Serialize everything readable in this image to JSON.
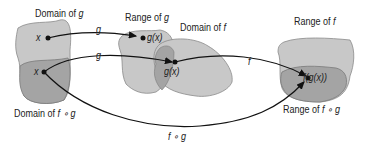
{
  "labels": {
    "domain_g": {
      "text": "Domain of ",
      "var": "g"
    },
    "range_g": {
      "text": "Range of ",
      "var": "g"
    },
    "domain_f": {
      "text": "Domain of ",
      "var": "f"
    },
    "range_f": {
      "text": "Range of ",
      "var": "f"
    },
    "domain_fg": {
      "text": "Domain of ",
      "var": "f ∘ g"
    },
    "range_fg": {
      "text": "Range of ",
      "var": "f ∘ g"
    }
  },
  "points": {
    "x1": "x",
    "x2": "x",
    "gx1": "g(x)",
    "gx2": "g(x)",
    "fgx": "f(g(x))"
  },
  "arrows": {
    "g_top": "g",
    "g_mid": "g",
    "f": "f",
    "fog": "f ∘ g"
  },
  "colors": {
    "light_region": "#c8c8c8",
    "dark_region": "#a4a4a4",
    "outline": "#7a7a7a",
    "stroke": "#111111"
  }
}
